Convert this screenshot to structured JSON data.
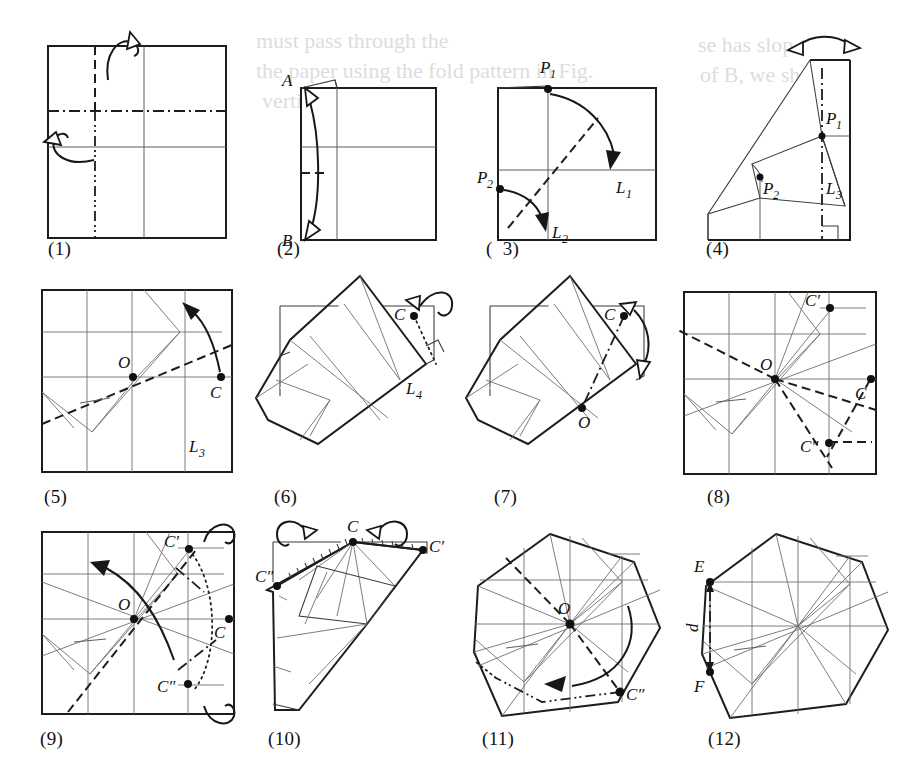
{
  "figure": {
    "kind": "origami-folding-sequence",
    "panel_count": 12,
    "background_ghost_text": [
      "...se has slop",
      "...must pass through the",
      "of B, we shall p",
      "the paper using the fold pattern in Fig.",
      "...vertical line in"
    ]
  },
  "panels": [
    {
      "id": "p1",
      "caption": "(1)",
      "shape": "square",
      "labels": [],
      "creases": [
        "mountain-vertical-upper",
        "valley-vertical-lower",
        "valley-horizontal-upper",
        "solid-horizontal-mid",
        "solid-vertical-right"
      ],
      "arrows": [
        "fold-over-top",
        "fold-over-left"
      ]
    },
    {
      "id": "p2",
      "caption": "(2)",
      "shape": "rectangle-folded",
      "labels": [
        "A",
        "B"
      ],
      "creases": [
        "solid-horizontal-mid",
        "mountain-short-left",
        "solid-vertical"
      ],
      "arrows": [
        "double-headed-vertical"
      ]
    },
    {
      "id": "p3",
      "caption": "(  3)",
      "shape": "square",
      "labels": [
        "P_1",
        "P_2",
        "L_1",
        "L_2"
      ],
      "creases": [
        "diagonal-dashed",
        "solid-horizontal",
        "solid-vertical"
      ],
      "arrows": [
        "curve-P1-to-L1",
        "curve-P2-to-L2"
      ]
    },
    {
      "id": "p4",
      "caption": "(4)",
      "shape": "folded-polygon",
      "labels": [
        "P_1",
        "P_2",
        "L_3"
      ],
      "creases": [
        "dash-dot-vertical",
        "right-angle-mark",
        "angle-mark"
      ],
      "arrows": [
        "double-headed-top-arc"
      ]
    },
    {
      "id": "p5",
      "caption": "(5)",
      "shape": "square",
      "labels": [
        "O",
        "C",
        "L_3"
      ],
      "creases": [
        "grid-lines",
        "mountain-diagonal",
        "tick-mark"
      ],
      "arrows": [
        "curve-C-upward"
      ]
    },
    {
      "id": "p6",
      "caption": "(6)",
      "shape": "rotated-folded",
      "labels": [
        "C",
        "L_4"
      ],
      "creases": [
        "dotted-perpendicular",
        "right-angle-mark"
      ],
      "arrows": [
        "loop-fold-over"
      ]
    },
    {
      "id": "p7",
      "caption": "(7)",
      "shape": "rotated-folded",
      "labels": [
        "C",
        "O"
      ],
      "creases": [
        "dash-dot-to-O"
      ],
      "arrows": [
        "double-headed-arc-right"
      ]
    },
    {
      "id": "p8",
      "caption": "(8)",
      "shape": "square",
      "labels": [
        "O",
        "C",
        "C'",
        "C″"
      ],
      "creases": [
        "grid-lines",
        "dashed-rays-from-O",
        "tick-mark"
      ],
      "arrows": []
    },
    {
      "id": "p9",
      "caption": "(9)",
      "shape": "square",
      "labels": [
        "O",
        "C",
        "C'",
        "C″"
      ],
      "creases": [
        "grid-lines",
        "dashed-diagonal",
        "dotted-arc-right",
        "tick-mark"
      ],
      "arrows": [
        "curve-left",
        "loop-top-right",
        "loop-bottom-right"
      ]
    },
    {
      "id": "p10",
      "caption": "(10)",
      "shape": "rotated-folded",
      "labels": [
        "C",
        "C'",
        "C″"
      ],
      "creases": [
        "hatched-edges"
      ],
      "arrows": [
        "loop-left",
        "loop-right"
      ]
    },
    {
      "id": "p11",
      "caption": "(11)",
      "shape": "heptagon",
      "labels": [
        "O",
        "C″"
      ],
      "creases": [
        "grid-lines",
        "dashed-O-to-C2",
        "dash-dot-dot-lower",
        "tick-mark"
      ],
      "arrows": [
        "curve-sweep-left"
      ]
    },
    {
      "id": "p12",
      "caption": "(12)",
      "shape": "heptagon",
      "labels": [
        "E",
        "F",
        "d"
      ],
      "creases": [
        "grid-lines",
        "dash-dot-vertical-EF",
        "tick-mark"
      ],
      "arrows": [
        "dimension-EF"
      ]
    }
  ],
  "labels": {
    "A": "A",
    "B": "B",
    "C": "C",
    "C_prime": "C′",
    "C_dprime": "C″",
    "O": "O",
    "E": "E",
    "F": "F",
    "d": "d",
    "P": "P",
    "L": "L",
    "one": "1",
    "two": "2",
    "three": "3",
    "four": "4"
  },
  "captions": {
    "c1": "(1)",
    "c2": "(2)",
    "c3": "(  3)",
    "c4": "(4)",
    "c5": "(5)",
    "c6": "(6)",
    "c7": "(7)",
    "c8": "(8)",
    "c9": "(9)",
    "c10": "(10)",
    "c11": "(11)",
    "c12": "(12)"
  },
  "ghost": {
    "g1": "se has slop",
    "g2": "of B, we shall p",
    "g3": "must pass through the",
    "g4": "the paper using the fold pattern in Fig.",
    "g5": "vertical line in"
  },
  "colors": {
    "paper": "#ffffff",
    "edge": "#1d1d1d",
    "crease": "#545454",
    "ghost": "#d8d8d8"
  }
}
